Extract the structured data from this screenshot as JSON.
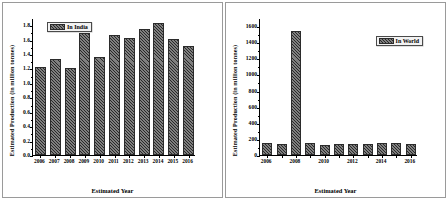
{
  "figure": {
    "panel_count": 2,
    "background": "#ffffff",
    "border_color": "#9a9a9a",
    "bar_fill": "#5b5b5b",
    "bar_edge": "#2b2b2b"
  },
  "chart_data": [
    {
      "id": "india",
      "type": "bar",
      "title": "",
      "xlabel": "Estimated Year",
      "ylabel": "Estimated Production (in million tonnes)",
      "legend": [
        "In India"
      ],
      "legend_position": "top-left",
      "grid": false,
      "categories": [
        "2006",
        "2007",
        "2008",
        "2009",
        "2010",
        "2011",
        "2012",
        "2013",
        "2014",
        "2015",
        "2016"
      ],
      "values": [
        1.22,
        1.33,
        1.21,
        1.69,
        1.36,
        1.66,
        1.62,
        1.75,
        1.83,
        1.61,
        1.51
      ],
      "ylim": [
        0.0,
        1.9
      ],
      "yticks": [
        0.0,
        0.2,
        0.4,
        0.6,
        0.8,
        1.0,
        1.2,
        1.4,
        1.6,
        1.8
      ],
      "ytick_labels": [
        "0.0",
        "0.2",
        "0.4",
        "0.6",
        "0.8",
        "1.0",
        "1.2",
        "1.4",
        "1.6",
        "1.8"
      ],
      "xtick_labels": [
        "2006",
        "2007",
        "2008",
        "2009",
        "2010",
        "2011",
        "2012",
        "2013",
        "2014",
        "2015",
        "2016"
      ]
    },
    {
      "id": "world",
      "type": "bar",
      "title": "",
      "xlabel": "Estimated Year",
      "ylabel": "Estimated Production (in million tonnes)",
      "legend": [
        "In World"
      ],
      "legend_position": "upper-right",
      "grid": false,
      "categories": [
        "2006",
        "2007",
        "2008",
        "2009",
        "2010",
        "2011",
        "2012",
        "2013",
        "2014",
        "2015",
        "2016"
      ],
      "values": [
        143,
        133,
        1540,
        150,
        128,
        132,
        133,
        142,
        146,
        145,
        139
      ],
      "ylim": [
        0,
        1700
      ],
      "yticks": [
        0,
        200,
        400,
        600,
        800,
        1000,
        1200,
        1400,
        1600
      ],
      "ytick_labels": [
        "0",
        "200",
        "400",
        "600",
        "800",
        "1000",
        "1200",
        "1400",
        "1600"
      ],
      "xtick_labels": [
        "2006",
        "",
        "2008",
        "",
        "2010",
        "",
        "2012",
        "",
        "2014",
        "",
        "2016"
      ]
    }
  ]
}
